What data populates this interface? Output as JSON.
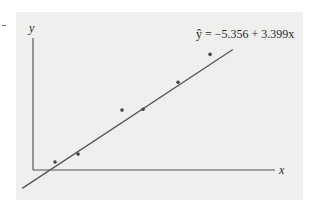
{
  "chart_data": {
    "type": "scatter",
    "title": "",
    "xlabel": "x",
    "ylabel": "y",
    "xlim": [
      0,
      22.4
    ],
    "ylim": [
      0,
      63
    ],
    "grid": false,
    "points": [
      {
        "x": 2.04,
        "y": 3.8
      },
      {
        "x": 4.17,
        "y": 7.6
      },
      {
        "x": 8.24,
        "y": 28.6
      },
      {
        "x": 10.19,
        "y": 29.0
      },
      {
        "x": 13.43,
        "y": 41.9
      },
      {
        "x": 16.39,
        "y": 55.2
      }
    ],
    "regression": {
      "intercept": -5.356,
      "slope": 3.399,
      "x_range": [
        -1.0,
        18.5
      ],
      "equation_label": "ŷ = −5.356 + 3.399x"
    },
    "colors": {
      "point": "#444444",
      "line": "#555555",
      "axis": "#555555",
      "background": "#efefed"
    }
  }
}
